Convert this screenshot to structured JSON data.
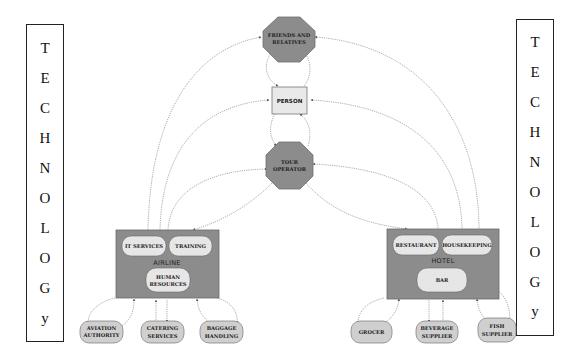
{
  "diagram": {
    "type": "stakeholder network diagram",
    "colors": {
      "octagon_fill": "#8c8c8c",
      "octagon_stroke": "#6e6e6e",
      "group_fill": "#8c8c8c",
      "inner_pill_fill": "#e6e6e6",
      "person_fill": "#e9e9e9",
      "edge": "#8a8a8a",
      "background": "#ffffff"
    },
    "side_labels": {
      "left": [
        "T",
        "E",
        "C",
        "H",
        "N",
        "O",
        "L",
        "O",
        "G",
        "y"
      ],
      "right": [
        "T",
        "E",
        "C",
        "H",
        "N",
        "O",
        "L",
        "O",
        "G",
        "y"
      ]
    },
    "nodes": {
      "friends": {
        "line1": "FRIENDS AND",
        "line2": "RELATIVES"
      },
      "person": {
        "label": "PERSON"
      },
      "tour_operator": {
        "line1": "TOUR",
        "line2": "OPERATOR"
      },
      "airline": {
        "label": "AIRLINE",
        "units": {
          "it_services": "IT SERVICES",
          "training": "TRAINING",
          "hr_line1": "HUMAN",
          "hr_line2": "RESOURCES"
        }
      },
      "hotel": {
        "label": "HOTEL",
        "units": {
          "restaurant": "RESTAURANT",
          "housekeeping": "HOUSEKEEPING",
          "bar": "BAR"
        }
      },
      "suppliers_airline": [
        {
          "line1": "AVIATION",
          "line2": "AUTHORITY"
        },
        {
          "line1": "CATERING",
          "line2": "SERVICES"
        },
        {
          "line1": "BAGGAGE",
          "line2": "HANDLING"
        }
      ],
      "suppliers_hotel": [
        {
          "line1": "GROCER",
          "line2": ""
        },
        {
          "line1": "BEVERAGE",
          "line2": "SUPPLIER"
        },
        {
          "line1": "FISH",
          "line2": "SUPPLIER"
        }
      ]
    }
  }
}
